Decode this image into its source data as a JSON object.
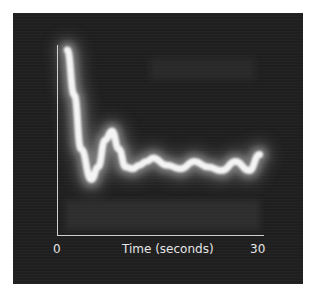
{
  "chart_data": {
    "type": "area",
    "title": "",
    "xlabel": "Time (seconds)",
    "ylabel": "",
    "x_ticks": [
      "0",
      "30"
    ],
    "xlim": [
      0,
      30
    ],
    "ylim": [
      0,
      1
    ],
    "grid": false,
    "legend": null,
    "series": [
      {
        "name": "bright trace (relative height, 1=top)",
        "x": [
          1.5,
          2.5,
          3.5,
          5,
          6,
          7,
          8,
          9,
          10,
          11,
          12,
          13,
          14,
          16,
          18,
          20,
          22,
          24,
          26,
          28,
          29.5
        ],
        "values": [
          1.0,
          0.75,
          0.45,
          0.28,
          0.35,
          0.5,
          0.55,
          0.45,
          0.35,
          0.34,
          0.36,
          0.38,
          0.4,
          0.36,
          0.34,
          0.38,
          0.35,
          0.33,
          0.38,
          0.33,
          0.42
        ]
      },
      {
        "name": "top band",
        "x": [
          1,
          29
        ],
        "values": [
          0.98,
          0.98
        ]
      }
    ]
  },
  "axes": {
    "x_start_label": "0",
    "x_end_label": "30",
    "x_title": "Time (seconds)"
  },
  "colors": {
    "background": "#1f1f1f",
    "trace": "#f4f4f4",
    "halo": "#8a8a8a",
    "axis": "#cfcfcf",
    "text": "#e6e6e6"
  }
}
